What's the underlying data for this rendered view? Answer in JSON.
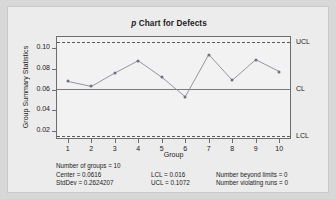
{
  "chart_data": {
    "type": "line",
    "title": "p Chart for Defects",
    "title_italic_prefix": "p",
    "title_rest": " Chart for Defects",
    "xlabel": "Group",
    "ylabel": "Group Summary Statistics",
    "categories": [
      1,
      2,
      3,
      4,
      5,
      6,
      7,
      8,
      9,
      10
    ],
    "x": [
      1,
      2,
      3,
      4,
      5,
      6,
      7,
      8,
      9,
      10
    ],
    "values": [
      0.068,
      0.063,
      0.076,
      0.088,
      0.072,
      0.053,
      0.094,
      0.069,
      0.089,
      0.0775
    ],
    "series": [
      {
        "name": "Group Summary Statistics",
        "values": [
          0.068,
          0.063,
          0.076,
          0.088,
          0.072,
          0.053,
          0.094,
          0.069,
          0.089,
          0.0775
        ]
      }
    ],
    "xlim": [
      0.5,
      10.5
    ],
    "ylim": [
      0.012,
      0.112
    ],
    "ytick_labels": [
      "0.02",
      "0.04",
      "0.06",
      "0.08",
      "0.10"
    ],
    "ytick_values": [
      0.02,
      0.04,
      0.06,
      0.08,
      0.1
    ],
    "xtick_labels": [
      "1",
      "2",
      "3",
      "4",
      "5",
      "6",
      "7",
      "8",
      "9",
      "10"
    ],
    "grid": false,
    "legend_position": "right-outside",
    "control_lines": [
      {
        "name": "UCL",
        "label": "UCL",
        "value": 0.1072,
        "style": "dashed"
      },
      {
        "name": "CL",
        "label": "CL",
        "value": 0.0616,
        "style": "solid"
      },
      {
        "name": "LCL",
        "label": "LCL",
        "value": 0.016,
        "style": "dashed"
      }
    ],
    "colors": {
      "point": "#6f6f80",
      "line": "#8a8a99",
      "axis": "#6d6d6d",
      "limit_line": "#5a5a5a",
      "center_line": "#7b7b7b",
      "plot_bg": "#f2f2f2",
      "card_bg": "#ececec",
      "page_bg": "#d8d8d8",
      "text": "#1b1b1b"
    }
  },
  "footer": {
    "col1": [
      "Number of groups = 10",
      "Center = 0.0616",
      "StdDev = 0.2624207"
    ],
    "col2": [
      "LCL = 0.016",
      "UCL = 0.1072"
    ],
    "col3": [
      "Number beyond limits = 0",
      "Number violating runs = 0"
    ]
  }
}
